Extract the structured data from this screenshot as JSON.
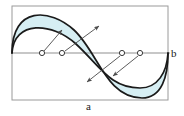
{
  "figure": {
    "type": "diagram",
    "title": "",
    "canvas": {
      "width": 184,
      "height": 116
    },
    "colors": {
      "band_fill": "#d6eef3",
      "curve_stroke": "#1a1a1a",
      "frame_stroke": "#9a9a9a",
      "axis_stroke": "#8f8f8f",
      "arrow_stroke": "#5b5b5b",
      "marker_stroke": "#4a4a4a",
      "marker_fill": "#ffffff",
      "background": "#ffffff",
      "text": "#1a1a1a"
    },
    "frame": {
      "x": 12,
      "y": 6,
      "width": 156,
      "height": 94
    },
    "axis": {
      "orientation": "horizontal",
      "y": 53,
      "x_start": 12,
      "x_end": 171
    },
    "labels": [
      {
        "id": "b",
        "text": "b",
        "x": 171,
        "y": 48,
        "role": "axis-label-right"
      },
      {
        "id": "a",
        "text": "a",
        "x": 86,
        "y": 101,
        "role": "axis-label-bottom"
      }
    ],
    "curves": [
      {
        "name": "outer-curve",
        "path": "M 12 53 C 12 6 50 8 74 30 C 98 52 106 98 142 98 C 162 98 168 76 168 53"
      },
      {
        "name": "inner-curve",
        "path": "M 12 53 C 14 20 52 22 76 44 C 100 66 110 88 140 88 C 158 88 167 72 168 53"
      }
    ],
    "band": {
      "name": "shaded-band",
      "path": "M 12 53 C 12 6 50 8 74 30 C 98 52 106 98 142 98 C 162 98 168 76 168 53 C 167 72 158 88 140 88 C 110 88 100 66 76 44 C 52 22 14 20 12 53 Z"
    },
    "markers": [
      {
        "id": "m1",
        "cx": 42,
        "cy": 53,
        "r": 2.6,
        "shape": "open-circle"
      },
      {
        "id": "m2",
        "cx": 62,
        "cy": 53,
        "r": 2.6,
        "shape": "open-circle"
      },
      {
        "id": "m3",
        "cx": 122,
        "cy": 53,
        "r": 2.6,
        "shape": "open-circle"
      },
      {
        "id": "m4",
        "cx": 140,
        "cy": 53,
        "r": 2.6,
        "shape": "open-circle"
      }
    ],
    "arrows": [
      {
        "id": "a1",
        "from_x": 44,
        "from_y": 51,
        "to_x": 62,
        "to_y": 30,
        "direction": "up-right",
        "source_marker": "m1"
      },
      {
        "id": "a2",
        "from_x": 65,
        "from_y": 51,
        "to_x": 99,
        "to_y": 26,
        "direction": "up-right",
        "source_marker": "m2"
      },
      {
        "id": "a3",
        "from_x": 120,
        "from_y": 56,
        "to_x": 87,
        "to_y": 82,
        "direction": "down-left",
        "source_marker": "m3"
      },
      {
        "id": "a4",
        "from_x": 138,
        "from_y": 56,
        "to_x": 113,
        "to_y": 76,
        "direction": "down-left",
        "source_marker": "m4"
      }
    ]
  }
}
